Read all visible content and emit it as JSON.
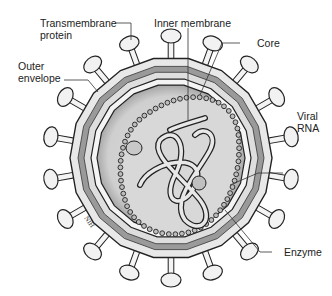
{
  "figure": {
    "signature": "NIH",
    "colors": {
      "outline": "#222222",
      "envelope_light": "#e6e6e6",
      "envelope_mid": "#b4b4b4",
      "envelope_dark": "#8c8c8c",
      "core_fill": "#d2d2d2",
      "spike_fill": "#f2f2f2",
      "background": "#ffffff"
    },
    "labels": [
      {
        "id": "transmembrane-protein",
        "text": "Transmembrane\nprotein"
      },
      {
        "id": "inner-membrane",
        "text": "Inner membrane"
      },
      {
        "id": "outer-envelope",
        "text": "Outer\nenvelope"
      },
      {
        "id": "core",
        "text": "Core"
      },
      {
        "id": "viral-rna",
        "text": "Viral\nRNA"
      },
      {
        "id": "enzyme",
        "text": "Enzyme"
      }
    ],
    "spike_count": 18
  }
}
